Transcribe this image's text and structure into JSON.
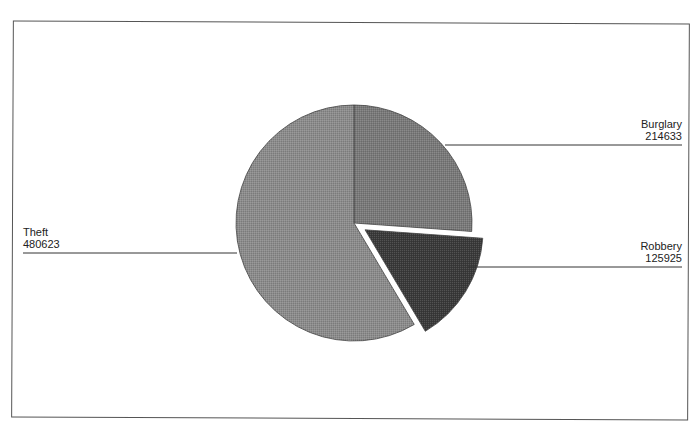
{
  "chart_data": {
    "type": "pie",
    "title": "",
    "slices": [
      {
        "label": "Burglary",
        "value": 214633,
        "color": "#7a7a7a",
        "exploded": false
      },
      {
        "label": "Robbery",
        "value": 125925,
        "color": "#3a3a3a",
        "exploded": true
      },
      {
        "label": "Theft",
        "value": 480623,
        "color": "#8c8c8c",
        "exploded": false
      }
    ],
    "start_angle": "12 o'clock, clockwise",
    "legend": "none (leader-line labels)"
  },
  "labels": {
    "burglary": {
      "name": "Burglary",
      "value": "214633"
    },
    "robbery": {
      "name": "Robbery",
      "value": "125925"
    },
    "theft": {
      "name": "Theft",
      "value": "480623"
    }
  }
}
